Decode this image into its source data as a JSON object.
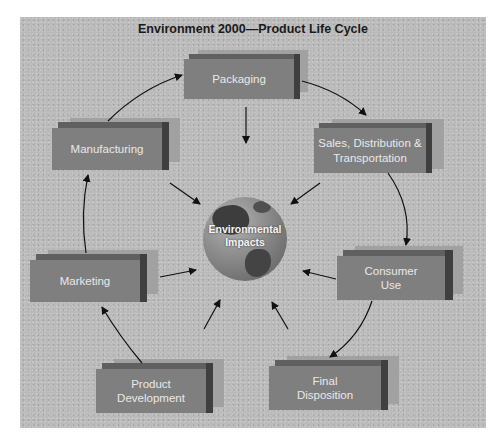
{
  "title": "Environment 2000—Product Life Cycle",
  "center": {
    "line1": "Environmental",
    "line2": "Impacts",
    "icon": "globe-icon"
  },
  "stages": [
    {
      "id": "packaging",
      "line1": "Packaging",
      "line2": ""
    },
    {
      "id": "sales",
      "line1": "Sales, Distribution &",
      "line2": "Transportation"
    },
    {
      "id": "consumer-use",
      "line1": "Consumer",
      "line2": "Use"
    },
    {
      "id": "final-disposition",
      "line1": "Final",
      "line2": "Disposition"
    },
    {
      "id": "product-development",
      "line1": "Product",
      "line2": "Development"
    },
    {
      "id": "marketing",
      "line1": "Marketing",
      "line2": ""
    },
    {
      "id": "manufacturing",
      "line1": "Manufacturing",
      "line2": ""
    }
  ],
  "colors": {
    "panel": "#b9b9b9",
    "box_face": "#7f7f7f",
    "box_top": "#606060",
    "box_side": "#3f3f3f",
    "box_shadow": "#a1a1a1",
    "box_text": "#e9e9e9",
    "arrow": "#111111"
  }
}
